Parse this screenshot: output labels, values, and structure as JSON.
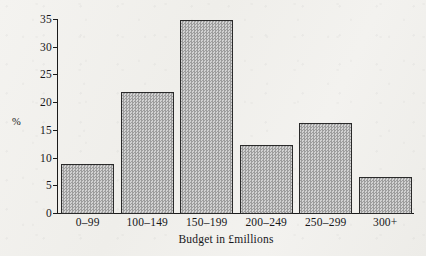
{
  "chart_data": {
    "type": "bar",
    "title": "",
    "xlabel": "Budget in £millions",
    "ylabel": "%",
    "categories": [
      "0–99",
      "100–149",
      "150–199",
      "200–249",
      "250–299",
      "300+"
    ],
    "values": [
      9.1,
      22.0,
      35.0,
      12.4,
      16.4,
      6.6
    ],
    "ylim": [
      0,
      35
    ],
    "yticks": [
      0,
      5,
      10,
      15,
      20,
      25,
      30,
      35
    ],
    "ytick_labels": [
      "0",
      "5",
      "10",
      "15",
      "20",
      "25",
      "30",
      "35"
    ],
    "grid": false,
    "legend": false,
    "bar_fill_color": "#a8a8a8",
    "bar_edge_color": "#2a2a2a",
    "background_color": "#f2f1ee",
    "axis_color": "#1b1b1b"
  }
}
